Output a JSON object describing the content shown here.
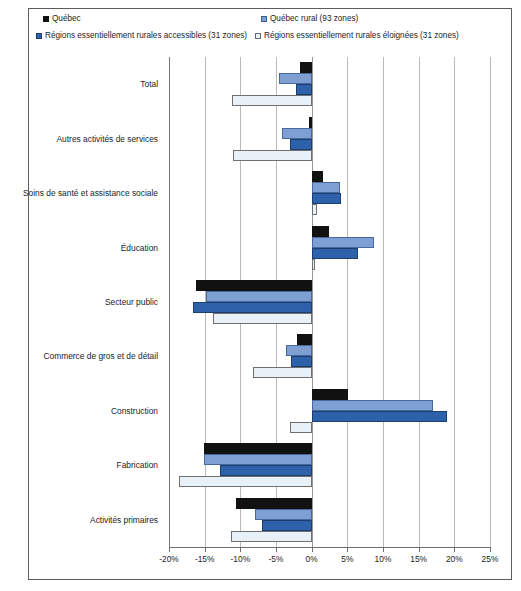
{
  "chart_data": {
    "type": "bar",
    "orientation": "horizontal",
    "title": "",
    "subtitle": "",
    "xlabel": "",
    "ylabel": "",
    "xlim": [
      -20,
      25
    ],
    "xtick_step": 5,
    "grid": true,
    "legend_position": "top",
    "tick_labels": [
      "-20%",
      "-15%",
      "-10%",
      "-5%",
      "0%",
      "5%",
      "10%",
      "15%",
      "20%",
      "25%"
    ],
    "tick_values": [
      -20,
      -15,
      -10,
      -5,
      0,
      5,
      10,
      15,
      20,
      25
    ],
    "categories": [
      "Total",
      "Autres activités de services",
      "Soins de santé et assistance sociale",
      "Éducation",
      "Secteur public",
      "Commerce de gros et de détail",
      "Construction",
      "Fabrication",
      "Activités primaires"
    ],
    "series": [
      {
        "name": "Québec",
        "color": "#111111",
        "values": [
          -1.6,
          -0.4,
          1.6,
          2.4,
          -16.2,
          -2.0,
          5.1,
          -15.1,
          -10.6
        ]
      },
      {
        "name": "Québec rural  (93 zones)",
        "color": "#7e9fd1",
        "values": [
          -4.6,
          -4.2,
          4.0,
          8.8,
          -14.8,
          -3.6,
          17.0,
          -15.1,
          -8.0
        ]
      },
      {
        "name": "Régions essentiellement rurales accessibles (31  zones)",
        "color": "#2d62ab",
        "values": [
          -2.2,
          -3.0,
          4.1,
          6.5,
          -16.6,
          -2.9,
          19.0,
          -12.9,
          -7.0
        ]
      },
      {
        "name": "Régions essentiellement rurales éloignées (31 zones)",
        "color": "#e9f1f8",
        "values": [
          -11.2,
          -11.0,
          0.7,
          0.5,
          -13.9,
          -8.2,
          -3.0,
          -18.6,
          -11.3
        ]
      }
    ]
  },
  "legend": {
    "items": [
      {
        "label": "Québec",
        "marker": "square-black-icon"
      },
      {
        "label": "Québec rural  (93 zones)",
        "marker": "square-lightblue-icon"
      },
      {
        "label": "Régions essentiellement rurales accessibles (31  zones)",
        "marker": "square-blue-icon"
      },
      {
        "label": "Régions essentiellement rurales éloignées (31 zones)",
        "marker": "square-white-icon"
      }
    ]
  }
}
